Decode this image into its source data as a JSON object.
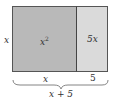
{
  "figure": {
    "square": {
      "area_label": "x",
      "area_exp": "2",
      "fill": "#b9b9b9"
    },
    "rectangle": {
      "area_label": "5x",
      "fill": "#dadada"
    },
    "left_side_label": "x",
    "bottom_labels": {
      "left": "x",
      "right": "5"
    },
    "total_label": "x + 5",
    "border_color": "#555555"
  }
}
